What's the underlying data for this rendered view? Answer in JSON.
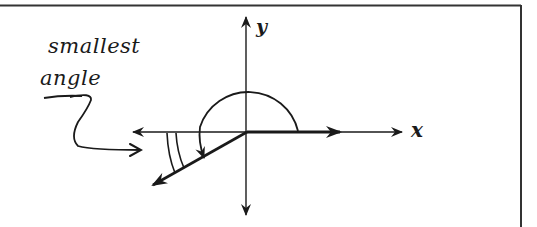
{
  "diagram": {
    "annotation": {
      "line1": "smallest",
      "line2": "angle"
    },
    "axes": {
      "x_label": "x",
      "y_label": "y"
    },
    "colors": {
      "ink": "#1a1a1a",
      "frame": "#333333",
      "background": "#ffffff"
    },
    "elements": [
      {
        "id": "frame",
        "type": "partial-border",
        "sides": [
          "top",
          "right"
        ]
      },
      {
        "id": "x-axis",
        "type": "double-arrow-line",
        "from": [
          133,
          132
        ],
        "to": [
          402,
          132
        ]
      },
      {
        "id": "y-axis",
        "type": "double-arrow-line",
        "from": [
          246,
          17
        ],
        "to": [
          246,
          215
        ]
      },
      {
        "id": "vector-a",
        "type": "arrow",
        "from": [
          247,
          132
        ],
        "to": [
          340,
          132
        ],
        "weight": "thick"
      },
      {
        "id": "vector-b",
        "type": "arrow",
        "from": [
          247,
          132
        ],
        "to": [
          153,
          185
        ],
        "weight": "thick"
      },
      {
        "id": "large-angle-arc",
        "type": "arc-arrow",
        "note": "reflex arc from vector-a over the top to vector-b"
      },
      {
        "id": "small-angle-marks",
        "type": "double-arc",
        "note": "between negative x-axis and vector-b"
      },
      {
        "id": "pointer-squiggle",
        "type": "curved-arrow",
        "note": "from label to the small angle"
      }
    ]
  }
}
